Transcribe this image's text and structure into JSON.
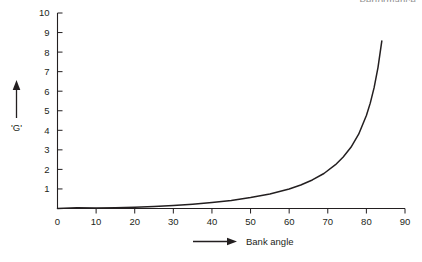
{
  "page": {
    "corner_title": "Performance",
    "background_color": "#ffffff",
    "ink_color": "#231f20"
  },
  "chart_data": {
    "type": "line",
    "title": "Performance",
    "xlabel": "Bank angle",
    "ylabel": "'G'",
    "xlim": [
      0,
      90
    ],
    "ylim": [
      0,
      10
    ],
    "xticks": [
      0,
      10,
      20,
      30,
      40,
      50,
      60,
      70,
      80,
      90
    ],
    "yticks": [
      1,
      2,
      3,
      4,
      5,
      6,
      7,
      8,
      9,
      10
    ],
    "grid": false,
    "legend": false,
    "series": [
      {
        "name": "Load factor vs bank angle",
        "color": "#231f20",
        "x": [
          0,
          5,
          10,
          15,
          20,
          25,
          30,
          35,
          40,
          45,
          50,
          55,
          60,
          63,
          66,
          69,
          72,
          74,
          76,
          78,
          80,
          81,
          82,
          83,
          84
        ],
        "values": [
          0.0,
          0.04,
          0.02,
          0.04,
          0.06,
          0.1,
          0.15,
          0.22,
          0.31,
          0.41,
          0.56,
          0.74,
          1.0,
          1.2,
          1.46,
          1.79,
          2.24,
          2.63,
          3.13,
          3.8,
          4.76,
          5.39,
          6.18,
          7.21,
          8.57
        ],
        "formula": "G = 1/cos(bank angle) - 1"
      }
    ],
    "annotations": []
  },
  "axes": {
    "y_arrow_name": "y-axis-up-arrow",
    "x_arrow_name": "x-axis-right-arrow"
  }
}
